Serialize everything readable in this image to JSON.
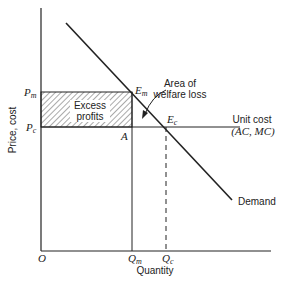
{
  "diagram": {
    "axes": {
      "y_label": "Price, cost",
      "x_label": "Quantity",
      "origin_label": "O"
    },
    "price_ticks": [
      {
        "label": "P",
        "sub": "m",
        "meaning": "monopoly price"
      },
      {
        "label": "P",
        "sub": "c",
        "meaning": "competitive price"
      }
    ],
    "quantity_ticks": [
      {
        "label": "Q",
        "sub": "m",
        "meaning": "monopoly quantity"
      },
      {
        "label": "Q",
        "sub": "c",
        "meaning": "competitive quantity"
      }
    ],
    "points": [
      {
        "label": "E",
        "sub": "m"
      },
      {
        "label": "E",
        "sub": "c"
      },
      {
        "label": "A",
        "sub": ""
      }
    ],
    "curves": {
      "demand_label": "Demand",
      "unit_cost_label": "Unit cost",
      "unit_cost_sublabel": "(AC, MC)"
    },
    "regions": {
      "excess_profits_line1": "Excess",
      "excess_profits_line2": "profits",
      "welfare_loss_line1": "Area of",
      "welfare_loss_line2": "welfare loss"
    },
    "colors": {
      "ink": "#222222",
      "hatch": "#555555",
      "background": "#ffffff"
    }
  }
}
